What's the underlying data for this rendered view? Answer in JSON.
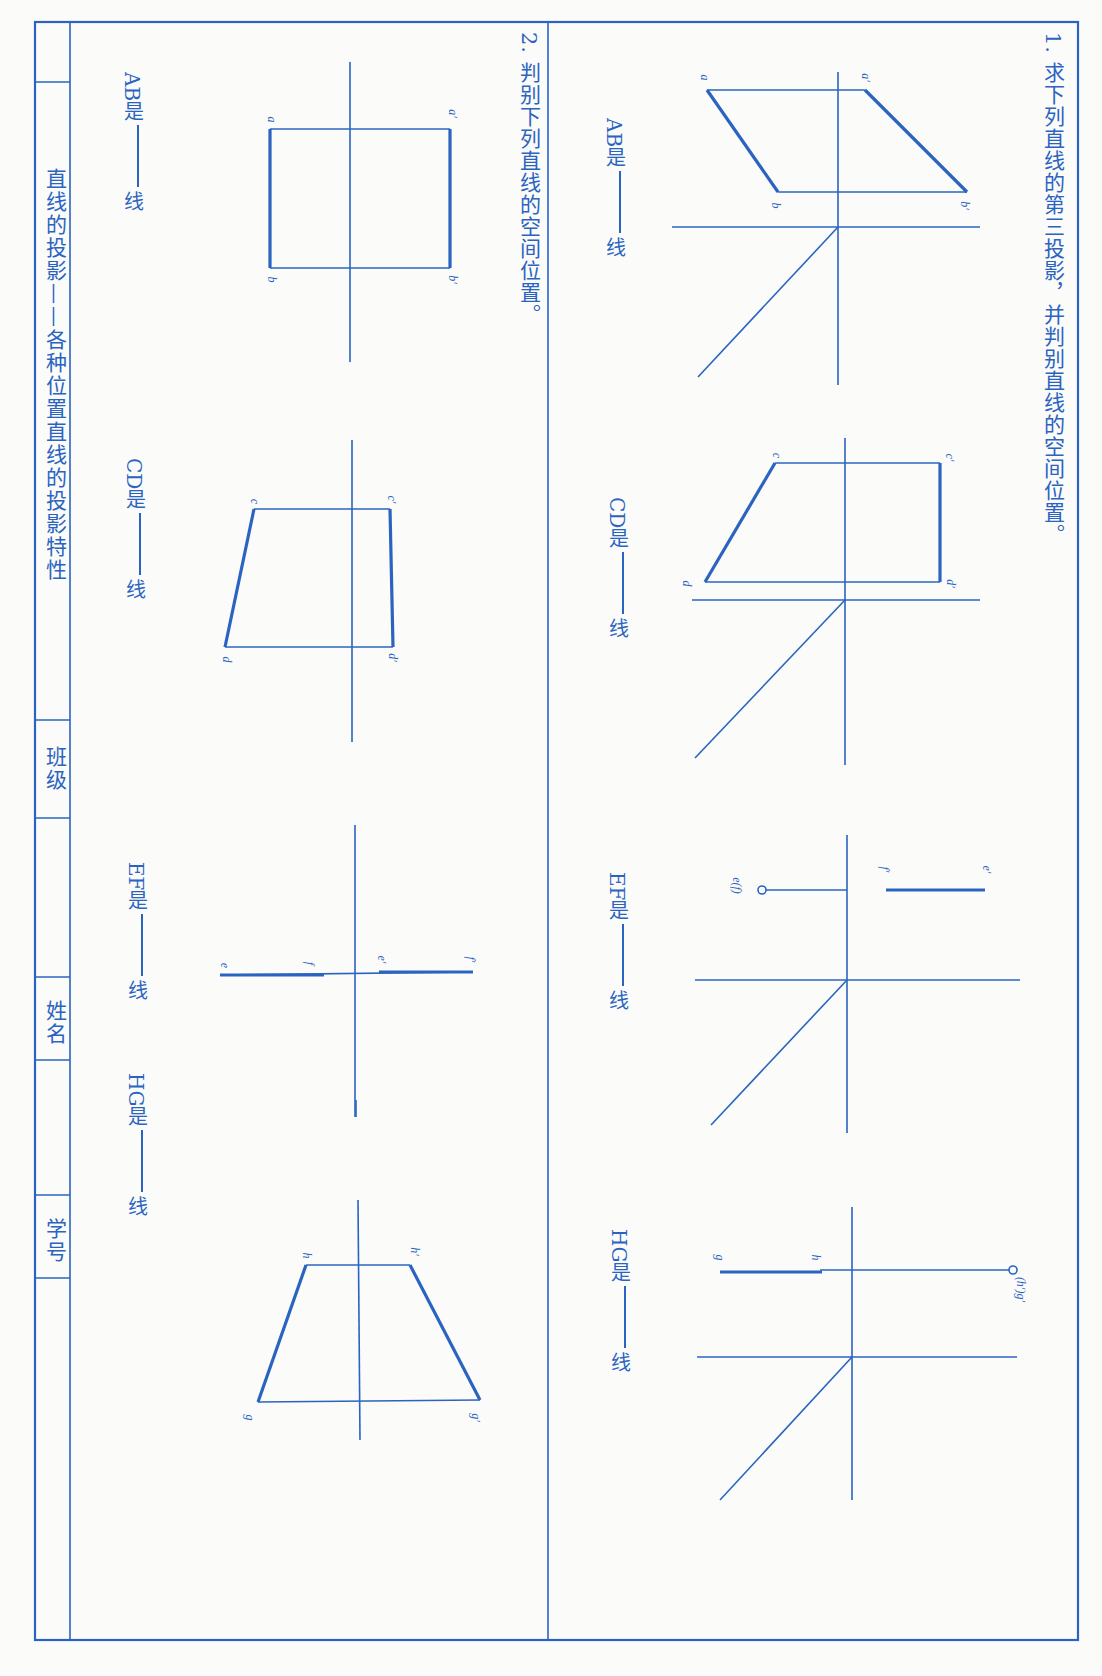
{
  "orientation": "rotated-90-clockwise",
  "ink_color": "#2a64c0",
  "section1": {
    "title": "1. 求下列直线的第三投影，并判别直线的空间位置。",
    "problems": [
      {
        "id": "AB",
        "answer_prefix": "AB是",
        "answer_suffix": "线",
        "labels": [
          "a′",
          "b′",
          "a",
          "b"
        ]
      },
      {
        "id": "CD",
        "answer_prefix": "CD是",
        "answer_suffix": "线",
        "labels": [
          "c′",
          "d′",
          "c",
          "d"
        ]
      },
      {
        "id": "EF",
        "answer_prefix": "EF是",
        "answer_suffix": "线",
        "labels": [
          "f′",
          "e′",
          "e(f)"
        ]
      },
      {
        "id": "HG",
        "answer_prefix": "HG是",
        "answer_suffix": "线",
        "labels": [
          "(h′)g′",
          "h",
          "g"
        ]
      }
    ]
  },
  "section2": {
    "title": "2. 判别下列直线的空间位置。",
    "problems": [
      {
        "id": "AB",
        "answer_prefix": "AB是",
        "answer_suffix": "线",
        "labels": [
          "a′",
          "b′",
          "a",
          "b"
        ]
      },
      {
        "id": "CD",
        "answer_prefix": "CD是",
        "answer_suffix": "线",
        "labels": [
          "c′",
          "d′",
          "c",
          "d"
        ]
      },
      {
        "id": "EF",
        "answer_prefix": "EF是",
        "answer_suffix": "线",
        "labels": [
          "e′",
          "f′",
          "e",
          "f"
        ]
      },
      {
        "id": "HG",
        "answer_prefix": "HG是",
        "answer_suffix": "线",
        "labels": [
          "h′",
          "g′",
          "h",
          "g"
        ]
      }
    ]
  },
  "title_block": {
    "heading": "直线的投影——各种位置直线的投影特性",
    "class_label": "班级",
    "class_value": "",
    "name_label": "姓名",
    "name_value": "",
    "id_label": "学号",
    "id_value": ""
  }
}
